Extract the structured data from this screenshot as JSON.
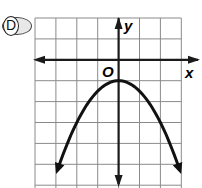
{
  "choice": {
    "label": "D"
  },
  "axes": {
    "x_label": "x",
    "y_label": "y",
    "origin_label": "O"
  },
  "colors": {
    "grid": "#8a8a8a",
    "axis": "#1a1a1a",
    "curve": "#111111"
  },
  "chart_data": {
    "type": "line",
    "title": "",
    "xlabel": "x",
    "ylabel": "y",
    "xlim": [
      -4,
      3
    ],
    "ylim": [
      -6,
      2
    ],
    "grid": true,
    "series": [
      {
        "name": "y = -0.5x^2 - 1",
        "x": [
          -3,
          -2.5,
          -2,
          -1.5,
          -1,
          -0.5,
          0,
          0.5,
          1,
          1.5,
          2,
          2.5,
          3
        ],
        "values": [
          -5.5,
          -4.125,
          -3,
          -2.125,
          -1.5,
          -1.125,
          -1,
          -1.125,
          -1.5,
          -2.125,
          -3,
          -4.125,
          -5.5
        ]
      }
    ],
    "annotations": [
      "vertex (0, -1)",
      "parabola opens downward",
      "arrows at both ends"
    ]
  }
}
